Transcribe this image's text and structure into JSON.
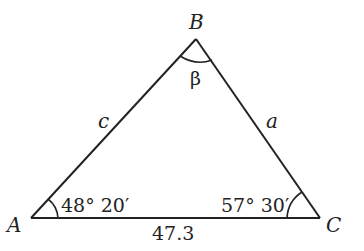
{
  "diagram": {
    "type": "triangle",
    "vertices": {
      "A": {
        "label": "A"
      },
      "B": {
        "label": "B"
      },
      "C": {
        "label": "C"
      }
    },
    "sides": {
      "a": {
        "label": "a"
      },
      "c": {
        "label": "c"
      },
      "b": {
        "label": "47.3"
      }
    },
    "angles": {
      "A": {
        "label": "48° 20′"
      },
      "B": {
        "label": "β"
      },
      "C": {
        "label": "57° 30′"
      }
    },
    "colors": {
      "stroke": "#222222",
      "background": "#ffffff"
    }
  }
}
